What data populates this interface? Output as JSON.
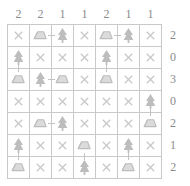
{
  "puzzle": {
    "name": "tents-and-trees-grid",
    "rows": 7,
    "cols": 7,
    "col_clues": [
      2,
      2,
      1,
      1,
      2,
      1,
      1
    ],
    "row_clues": [
      2,
      0,
      3,
      0,
      2,
      1,
      2
    ],
    "cell_types": {
      "x": "blank-marker",
      "tent": "tent-icon",
      "tree": "tree-icon"
    },
    "grid": [
      [
        "x",
        "tent",
        "tree",
        "x",
        "tent",
        "tree",
        "x"
      ],
      [
        "tree",
        "x",
        "x",
        "x",
        "tree",
        "x",
        "x"
      ],
      [
        "tent",
        "tree",
        "tent",
        "x",
        "tent",
        "x",
        "x"
      ],
      [
        "x",
        "x",
        "x",
        "x",
        "x",
        "x",
        "tree"
      ],
      [
        "x",
        "tent",
        "tree",
        "x",
        "x",
        "x",
        "tent"
      ],
      [
        "tree",
        "x",
        "x",
        "tent",
        "x",
        "tree",
        "x"
      ],
      [
        "tent",
        "x",
        "x",
        "tree",
        "x",
        "tent",
        "x"
      ]
    ],
    "links": [
      {
        "row": 0,
        "col": 1,
        "dir": "h"
      },
      {
        "row": 0,
        "col": 4,
        "dir": "h"
      },
      {
        "row": 1,
        "col": 0,
        "dir": "v"
      },
      {
        "row": 1,
        "col": 4,
        "dir": "v"
      },
      {
        "row": 2,
        "col": 1,
        "dir": "h"
      },
      {
        "row": 3,
        "col": 6,
        "dir": "v"
      },
      {
        "row": 4,
        "col": 1,
        "dir": "h"
      },
      {
        "row": 5,
        "col": 0,
        "dir": "v"
      },
      {
        "row": 5,
        "col": 3,
        "dir": "v"
      },
      {
        "row": 5,
        "col": 5,
        "dir": "v"
      }
    ],
    "colors": {
      "grid_line": "#c9c9c9",
      "clue_text": "#8b8b8b",
      "icon": "#bdbdbd",
      "marker": "#c9c9c9",
      "background": "#ffffff"
    },
    "x_glyph": "×"
  }
}
